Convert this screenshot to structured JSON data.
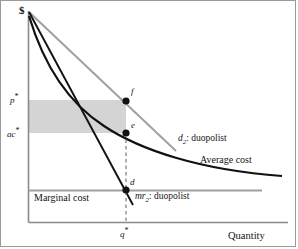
{
  "figure": {
    "kind": "economics-diagram",
    "title_visible": false
  },
  "axes": {
    "y_axis_label": "$",
    "x_axis_label": "Quantity",
    "y_ticks": [
      {
        "id": "price",
        "label": "p*",
        "text": "p",
        "star": "*"
      },
      {
        "id": "avg-cost",
        "label": "ac*",
        "text": "ac",
        "star": "*"
      }
    ],
    "x_ticks": [
      {
        "id": "quantity-star",
        "label": "q*",
        "text": "q",
        "star": "*"
      }
    ]
  },
  "curves": [
    {
      "id": "demand",
      "label_prefix": "d",
      "label_sub": "2",
      "label_suffix": ": duopolist",
      "full_label": "d2: duopolist",
      "color": "#a0a0a0",
      "style": "straight-line"
    },
    {
      "id": "marginal-revenue",
      "label_prefix": "mr",
      "label_sub": "2",
      "label_suffix": ": duopolist",
      "full_label": "mr2: duopolist",
      "color": "#111111",
      "style": "straight-line"
    },
    {
      "id": "average-cost",
      "full_label": "Average cost",
      "color": "#111111",
      "style": "convex-curve"
    },
    {
      "id": "marginal-cost",
      "full_label": "Marginal cost",
      "color": "#a0a0a0",
      "style": "horizontal-line"
    }
  ],
  "points": [
    {
      "id": "f",
      "label": "f",
      "x": 126,
      "y": 101
    },
    {
      "id": "e",
      "label": "e",
      "x": 126,
      "y": 133
    },
    {
      "id": "d",
      "label": "d",
      "x": 126,
      "y": 190
    }
  ],
  "shaded_region": {
    "id": "profit-rectangle",
    "color": "#d4d4d4",
    "description": "profit area between p* and ac* up to q*"
  },
  "colors": {
    "background": "#ffffff",
    "axis": "#8a8a8a",
    "gray_line": "#a0a0a0",
    "black_line": "#111111",
    "shade": "#d4d4d4",
    "border": "#9a9a9a",
    "text": "#141414"
  }
}
